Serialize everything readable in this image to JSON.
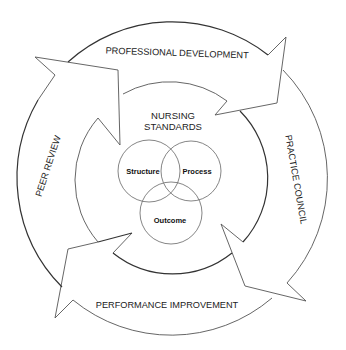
{
  "diagram": {
    "cycle_arrows": [
      {
        "id": "professional-development",
        "label": "PROFESSIONAL DEVELOPMENT"
      },
      {
        "id": "practice-council",
        "label": "PRACTICE COUNCIL"
      },
      {
        "id": "performance-improvement",
        "label": "PERFORMANCE IMPROVEMENT"
      },
      {
        "id": "peer-review",
        "label": "PEER REVIEW"
      }
    ],
    "center": {
      "title_line1": "NURSING",
      "title_line2": "STANDARDS"
    },
    "venn": [
      {
        "id": "structure",
        "label": "Structure"
      },
      {
        "id": "process",
        "label": "Process"
      },
      {
        "id": "outcome",
        "label": "Outcome"
      }
    ],
    "colors": {
      "background": "#ffffff",
      "stroke": "#555555",
      "text": "#222222"
    }
  }
}
